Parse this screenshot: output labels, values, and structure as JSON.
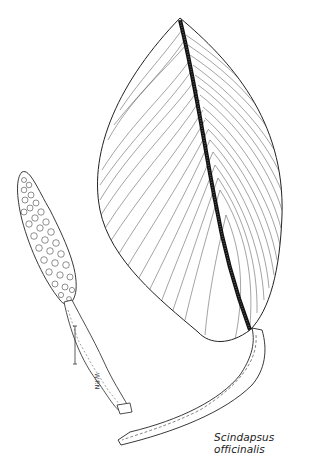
{
  "illustration": {
    "subject": "botanical line drawing",
    "caption": "Scindapsus officinalis",
    "signature": "W.P.N",
    "elements": [
      "leaf",
      "leaf-petiole",
      "spadix-inflorescence",
      "peduncle",
      "scale-bar"
    ]
  }
}
